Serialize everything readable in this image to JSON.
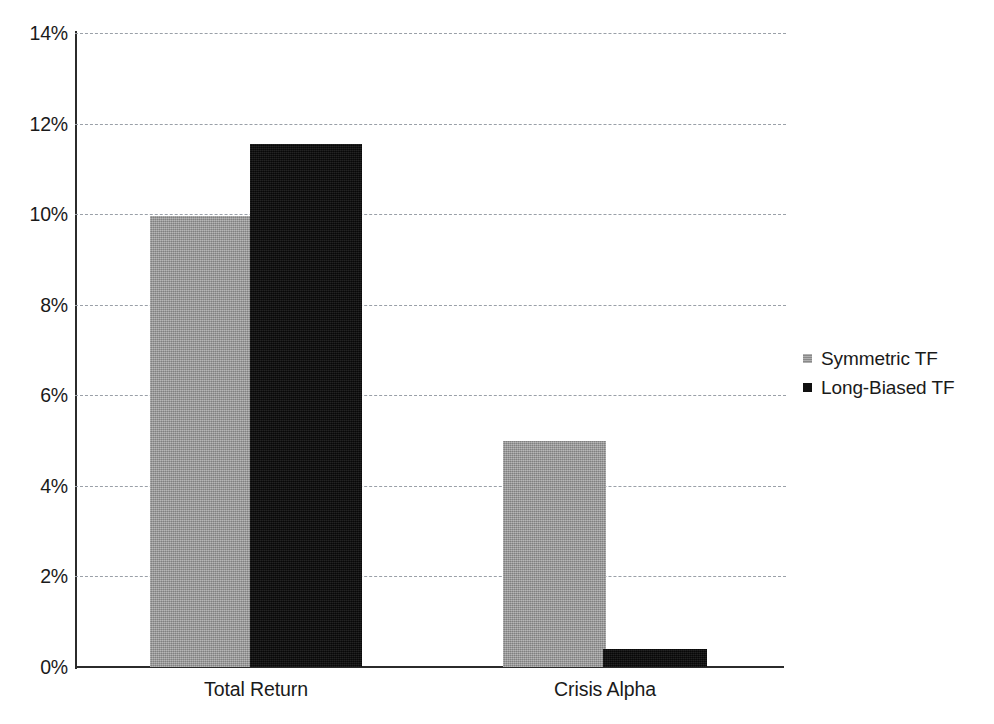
{
  "chart_data": {
    "type": "bar",
    "title": "",
    "subtitle": "",
    "xlabel": "",
    "ylabel": "",
    "categories": [
      "Total Return",
      "Crisis Alpha"
    ],
    "series": [
      {
        "name": "Symmetric TF",
        "color": "#9c9c9c",
        "values": [
          9.95,
          4.99
        ]
      },
      {
        "name": "Long-Biased TF",
        "color": "#0e0e0e",
        "values": [
          11.55,
          0.4
        ]
      }
    ],
    "value_unit": "%",
    "ylim": [
      0,
      14
    ],
    "ytick_step": 2,
    "ytick_labels": [
      "0%",
      "2%",
      "4%",
      "6%",
      "8%",
      "10%",
      "12%",
      "14%"
    ],
    "ytick_values": [
      0,
      2,
      4,
      6,
      8,
      10,
      12,
      14
    ],
    "grid": true,
    "grid_style": "dashed",
    "grid_color": "#9aa0a8",
    "axis_color": "#2b2b2b",
    "legend_position": "right",
    "background": "#ffffff"
  }
}
